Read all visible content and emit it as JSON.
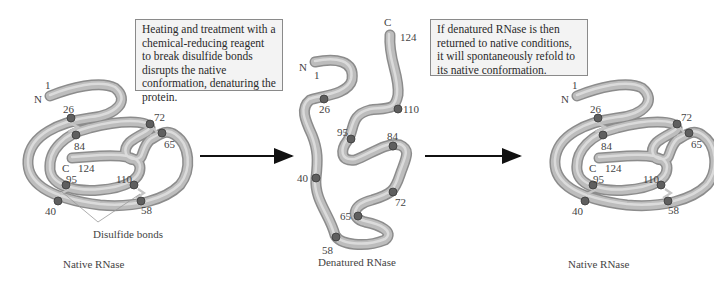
{
  "boxes": {
    "denature": "Heating and treatment with a chemical-reducing reagent to break disulfide bonds disrupts the native conformation, denaturing the protein.",
    "refold": "If denatured RNase is then returned to native conditions, it will spontaneously refold to its native conformation."
  },
  "captions": {
    "left": "Native RNase",
    "middle": "Denatured RNase",
    "right": "Native RNase"
  },
  "annotations": {
    "disulfide": "Disulfide bonds"
  },
  "terminals": {
    "n": "N",
    "c": "C"
  },
  "residues": {
    "r1": "1",
    "r26": "26",
    "r40": "40",
    "r58": "58",
    "r65": "65",
    "r72": "72",
    "r84": "84",
    "r95": "95",
    "r110": "110",
    "r124": "124"
  },
  "colors": {
    "tube": "#a9a9a9",
    "tube_highlight": "#e6e6e6",
    "cysteine": "#5a5a5a",
    "bond": "#c8c8c8",
    "arrow": "#111111"
  }
}
